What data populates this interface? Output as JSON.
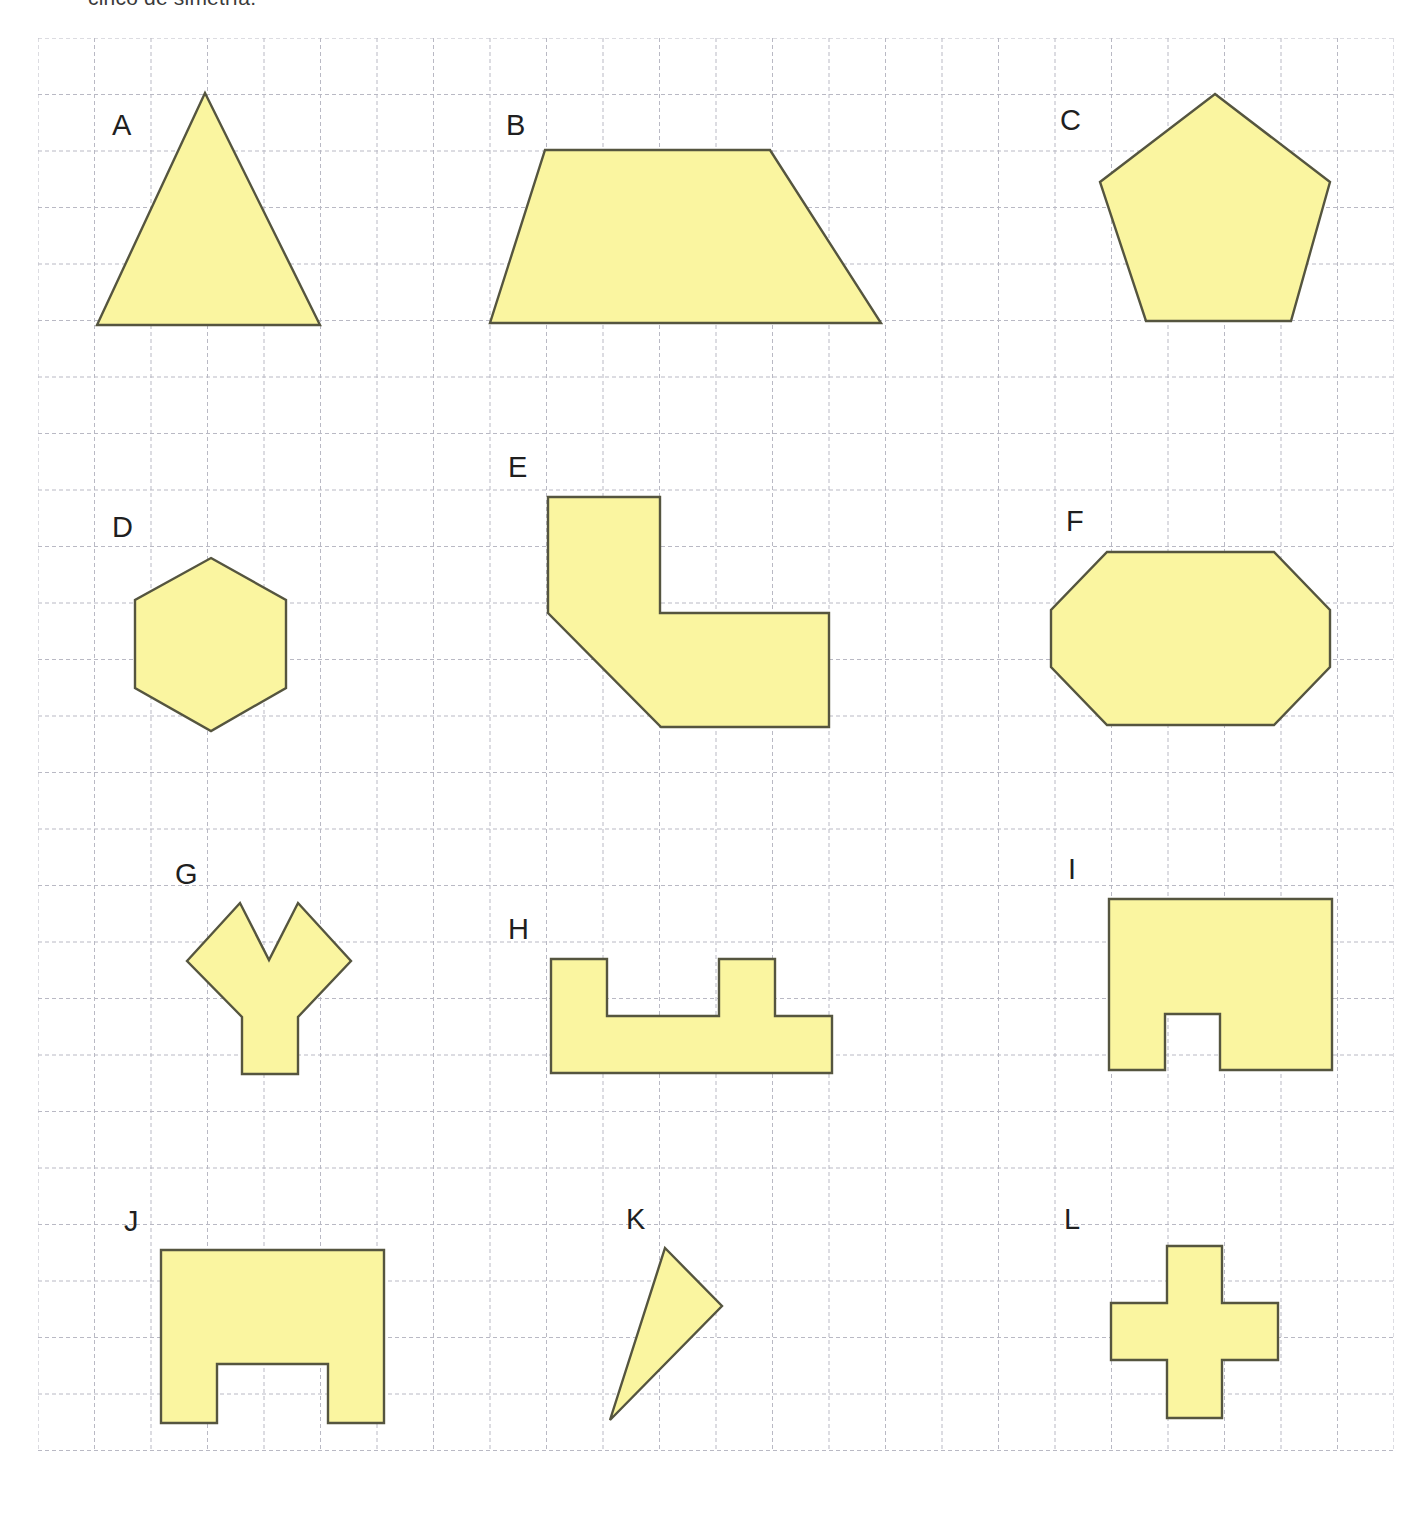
{
  "page": {
    "instruction": "cinco de simetría.",
    "background_color": "#ffffff",
    "width": 1423,
    "height": 1518
  },
  "grid": {
    "origin_x": 38,
    "origin_y": 38,
    "cell_size": 56.5,
    "cols": 24,
    "rows": 25,
    "line_color": "#b9b9c4",
    "line_style": "dashed",
    "border_color": "#b9b9c4"
  },
  "style": {
    "fill_color": "#faf5a0",
    "stroke_color": "#55553f",
    "stroke_width": 2.4,
    "label_color": "#1f1f1f"
  },
  "shapes": [
    {
      "id": "A",
      "name": "equilateral-triangle",
      "label": "A",
      "label_x": 112,
      "label_y": 111,
      "points": "205,93 320,325 97,325"
    },
    {
      "id": "B",
      "name": "isosceles-trapezoid",
      "label": "B",
      "label_x": 506,
      "label_y": 111,
      "points": "545,150 770,150 881,323 490,323"
    },
    {
      "id": "C",
      "name": "regular-pentagon",
      "label": "C",
      "label_x": 1060,
      "label_y": 106,
      "points": "1215,94 1330,182 1291,321 1146,321 1100,182"
    },
    {
      "id": "D",
      "name": "regular-hexagon",
      "label": "D",
      "label_x": 112,
      "label_y": 513,
      "points": "211,558 286,600 286,688 211,731 135,688 135,600"
    },
    {
      "id": "E",
      "name": "l-shape-with-bevel",
      "label": "E",
      "label_x": 508,
      "label_y": 453,
      "points": "548,497 660,497 660,613 829,613 829,727 661,727 548,613"
    },
    {
      "id": "F",
      "name": "octagon",
      "label": "F",
      "label_x": 1066,
      "label_y": 507,
      "points": "1107,552 1274,552 1330,610 1330,667 1274,725 1107,725 1051,667 1051,610"
    },
    {
      "id": "G",
      "name": "y-shaped-polygon",
      "label": "G",
      "label_x": 175,
      "label_y": 860,
      "points": "187,961 240,903 269,960 298,903 351,961 298,1017 298,1074 242,1074 242,1017"
    },
    {
      "id": "H",
      "name": "battlement-polygon",
      "label": "H",
      "label_x": 508,
      "label_y": 915,
      "points": "551,959 607,959 607,1016 719,1016 719,959 775,959 775,1016 832,1016 832,1073 551,1073"
    },
    {
      "id": "I",
      "name": "rectangle-with-notch",
      "label": "I",
      "label_x": 1068,
      "label_y": 855,
      "points": "1109,899 1332,899 1332,1070 1220,1070 1220,1014 1165,1014 1165,1070 1109,1070"
    },
    {
      "id": "J",
      "name": "rectangle-with-wide-notch",
      "label": "J",
      "label_x": 124,
      "label_y": 1207,
      "points": "161,1250 384,1250 384,1423 328,1423 328,1364 217,1364 217,1423 161,1423"
    },
    {
      "id": "K",
      "name": "scalene-triangle",
      "label": "K",
      "label_x": 626,
      "label_y": 1205,
      "points": "665,1248 722,1306 610,1420"
    },
    {
      "id": "L",
      "name": "cross-polygon",
      "label": "L",
      "label_x": 1064,
      "label_y": 1205,
      "points": "1167,1246 1222,1246 1222,1303 1278,1303 1278,1360 1222,1360 1222,1418 1167,1418 1167,1360 1111,1360 1111,1303 1167,1303"
    }
  ]
}
